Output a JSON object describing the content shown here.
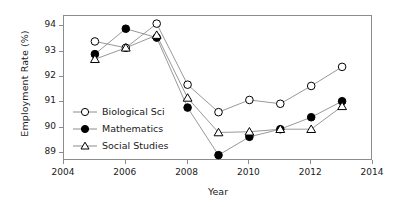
{
  "chart_data": {
    "type": "line",
    "title": "",
    "xlabel": "Year",
    "ylabel": "Employment Rate (%)",
    "x": [
      2005,
      2006,
      2007,
      2008,
      2009,
      2010,
      2011,
      2012,
      2013
    ],
    "xlim": [
      2004,
      2014
    ],
    "ylim": [
      88.7,
      94.4
    ],
    "xticks": [
      2004,
      2006,
      2008,
      2010,
      2012,
      2014
    ],
    "yticks": [
      89,
      90,
      91,
      92,
      93,
      94
    ],
    "grid": false,
    "legend_position": "lower-left-inside",
    "series": [
      {
        "name": "Biological Sci",
        "marker": "open-circle",
        "values": [
          93.4,
          93.15,
          94.1,
          91.7,
          90.62,
          91.1,
          90.95,
          91.65,
          92.4
        ]
      },
      {
        "name": "Mathematics",
        "marker": "filled-circle",
        "values": [
          92.9,
          93.9,
          93.55,
          90.8,
          88.93,
          89.65,
          89.95,
          90.42,
          91.05
        ]
      },
      {
        "name": "Social Studies",
        "marker": "open-triangle",
        "values": [
          92.7,
          93.15,
          93.65,
          91.18,
          89.82,
          89.85,
          89.95,
          89.95,
          90.85
        ]
      }
    ]
  },
  "axis": {
    "ytick_labels": [
      "89",
      "90",
      "91",
      "92",
      "93",
      "94"
    ],
    "xtick_labels": [
      "2004",
      "2006",
      "2008",
      "2010",
      "2012",
      "2014"
    ]
  },
  "legend": {
    "items": [
      {
        "label": "Biological Sci"
      },
      {
        "label": "Mathematics"
      },
      {
        "label": "Social Studies"
      }
    ]
  },
  "colors": {
    "line": "#8c8c8c",
    "frame": "#8c8c8c",
    "marker_fill_open": "#ffffff",
    "marker_fill_solid": "#000000",
    "marker_stroke": "#000000",
    "text": "#1a1a1a",
    "background": "#ffffff"
  }
}
